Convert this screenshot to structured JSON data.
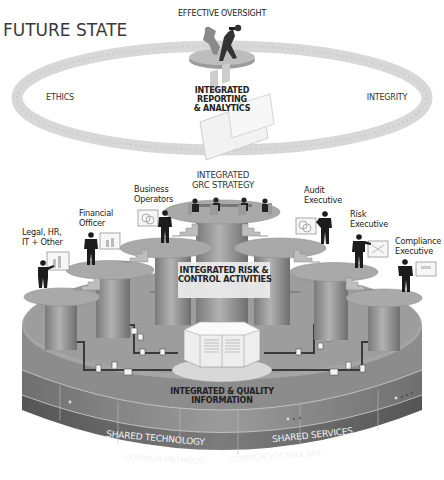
{
  "title": "FUTURE STATE",
  "oversight": {
    "label": "EFFECTIVE OVERSIGHT",
    "icon": "two-figures-with-binoculars-icon"
  },
  "ring": {
    "left_label": "ETHICS",
    "right_label": "INTEGRITY",
    "center_label_lines": [
      "INTEGRATED",
      "REPORTING",
      "& ANALYTICS"
    ],
    "center_icon": "report-chart-icon"
  },
  "strategy": {
    "label_lines": [
      "INTEGRATED",
      "GRC STRATEGY"
    ],
    "icon": "meeting-table-icon"
  },
  "risk_control": {
    "label_lines": [
      "INTEGRATED RISK &",
      "CONTROL ACTIVITIES"
    ]
  },
  "information": {
    "label_lines": [
      "INTEGRATED & QUALITY",
      "INFORMATION"
    ],
    "icon": "document-repository-icon"
  },
  "roles": [
    {
      "name": "legal-hr-it-other",
      "lines": [
        "Legal, HR,",
        "IT + Other"
      ],
      "board_icon": "bar-chart-icon"
    },
    {
      "name": "financial-officer",
      "lines": [
        "Financial",
        "Officer"
      ],
      "board_icon": "bar-chart-icon"
    },
    {
      "name": "business-operators",
      "lines": [
        "Business",
        "Operators"
      ],
      "board_icon": "venn-circles-icon"
    },
    {
      "name": "audit-executive",
      "lines": [
        "Audit",
        "Executive"
      ],
      "board_icon": "venn-circles-icon"
    },
    {
      "name": "risk-executive",
      "lines": [
        "Risk",
        "Executive"
      ],
      "board_icon": "network-icon"
    },
    {
      "name": "compliance-executive",
      "lines": [
        "Compliance",
        "Executive"
      ],
      "board_icon": "document-icon"
    }
  ],
  "base": {
    "layer1_left": "SHARED TECHNOLOGY",
    "layer1_right": "SHARED SERVICES",
    "layer2_left": "COMMON METHODS",
    "layer2_right": "COMMON VOCABULARY"
  },
  "colors": {
    "background": "#ffffff",
    "ring": "#d6d6d6",
    "platform_top": "#a9a9a9",
    "column": "#8f8f8f",
    "base_top": "#9a9a9a",
    "band_light": "#8a8a8a",
    "band_dark": "#6a6a6a",
    "figure": "#1c1c1c",
    "text": "#222222"
  }
}
